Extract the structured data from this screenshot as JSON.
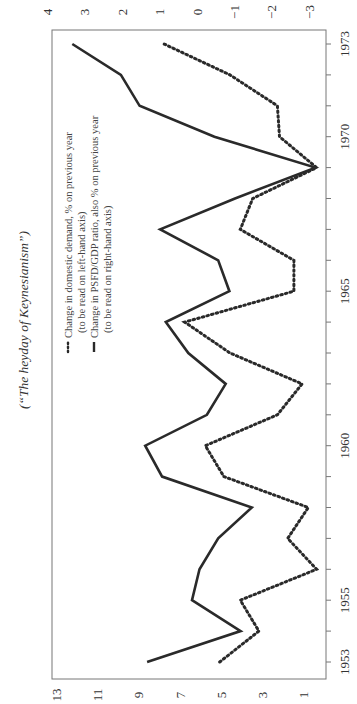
{
  "chart_data": {
    "type": "line",
    "title": "(“The heyday of Keynesianism”)",
    "orientation": "rotated 90° counter-clockwise",
    "xlabel": "",
    "x": [
      1953,
      1954,
      1955,
      1956,
      1957,
      1958,
      1959,
      1960,
      1961,
      1962,
      1963,
      1964,
      1965,
      1966,
      1967,
      1968,
      1969,
      1970,
      1971,
      1972,
      1973
    ],
    "x_tick_labels": [
      "1953",
      "1955",
      "1960",
      "1965",
      "1970",
      "1973"
    ],
    "left_axis": {
      "ticks": [
        1,
        3,
        5,
        7,
        9,
        11,
        13
      ],
      "range": [
        0,
        13.5
      ]
    },
    "right_axis": {
      "ticks": [
        -3,
        -2,
        -1,
        0,
        1,
        2,
        3,
        4
      ],
      "range": [
        -3.3,
        4.1
      ]
    },
    "series": [
      {
        "name": "Change in domestic demand, % on previous year (to be read on left-hand axis)",
        "style": "dotted",
        "axis": "left",
        "values": [
          5.1,
          3.2,
          4.1,
          0.4,
          1.8,
          0.8,
          4.9,
          5.8,
          2.3,
          1.1,
          4.6,
          6.8,
          1.5,
          1.5,
          4.1,
          3.5,
          0.4,
          2.2,
          2.3,
          4.6,
          7.8
        ]
      },
      {
        "name": "Change in PSFD/GDP ratio, also % on previous year (to be read on right-hand axis)",
        "style": "solid",
        "axis": "right",
        "values": [
          1.35,
          -1.15,
          0.15,
          -0.05,
          -0.55,
          -1.45,
          0.95,
          1.4,
          -0.25,
          -0.75,
          0.25,
          0.85,
          -0.85,
          -0.55,
          1.0,
          -1.0,
          -3.15,
          -0.45,
          1.55,
          2.05,
          3.35
        ]
      }
    ],
    "legend": [
      {
        "line1": "Change in domestic demand, % on previous year",
        "line2": "(to be read on left-hand axis)"
      },
      {
        "line1": "Change in PSFD/GDP ratio, also % on previous year",
        "line2": "(to be read on right-hand axis)"
      }
    ],
    "grid": false,
    "legend_position": "upper-middle"
  },
  "colors": {
    "line": "#2a2a2a",
    "axis": "#777777",
    "background": "#ffffff"
  }
}
